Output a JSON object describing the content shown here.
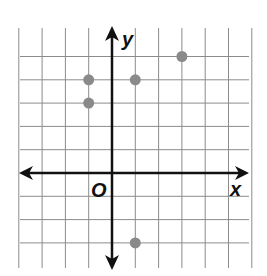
{
  "chart_data": {
    "type": "scatter",
    "title": "",
    "xlabel": "x",
    "ylabel": "y",
    "origin_label": "O",
    "grid": true,
    "xlim": [
      -4,
      6
    ],
    "ylim": [
      -4,
      6
    ],
    "points": [
      {
        "x": 3,
        "y": 5
      },
      {
        "x": -1,
        "y": 4
      },
      {
        "x": 1,
        "y": 4
      },
      {
        "x": -1,
        "y": 3
      },
      {
        "x": 1,
        "y": -3
      }
    ],
    "point_color": "#8a8a8a",
    "axis_color": "#111111",
    "grid_color": "#8c8c8c"
  }
}
